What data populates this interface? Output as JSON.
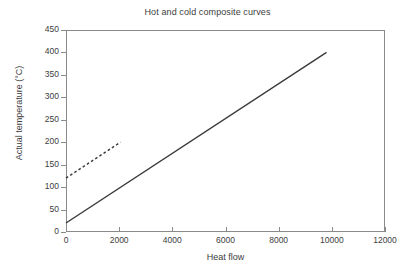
{
  "chart_data": {
    "type": "line",
    "title": "Hot and cold composite curves",
    "xlabel": "Heat flow",
    "ylabel": "Actual temperature (°C)",
    "xlim": [
      0,
      12000
    ],
    "ylim": [
      0,
      450
    ],
    "xticks": [
      0,
      2000,
      4000,
      6000,
      8000,
      10000,
      12000
    ],
    "xtick_labels": [
      "0",
      "2000",
      "4000",
      "6000",
      "8000",
      "10000",
      "12000"
    ],
    "yticks": [
      0,
      50,
      100,
      150,
      200,
      250,
      300,
      350,
      400,
      450
    ],
    "ytick_labels": [
      "0",
      "50",
      "100",
      "150",
      "200",
      "250",
      "300",
      "350",
      "400",
      "450"
    ],
    "grid": false,
    "legend": null,
    "series": [
      {
        "name": "hot composite curve",
        "style": "solid",
        "color": "#3a3a3a",
        "x": [
          0,
          9800
        ],
        "y": [
          20,
          400
        ]
      },
      {
        "name": "cold composite curve",
        "style": "dashed",
        "color": "#3a3a3a",
        "x": [
          0,
          2050
        ],
        "y": [
          120,
          200
        ]
      }
    ]
  },
  "colors": {
    "axis": "#8a8a8a",
    "text": "#3d3d3d",
    "line": "#3a3a3a",
    "background": "#ffffff"
  }
}
